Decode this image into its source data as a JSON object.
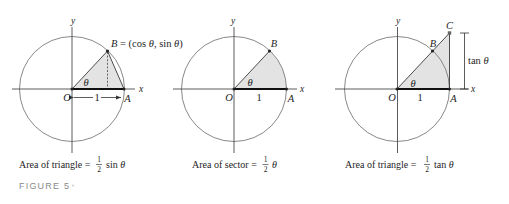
{
  "figure": {
    "label": "FIGURE 5"
  },
  "colors": {
    "shade": "#e3e3e3",
    "circle": "#7a7a7a",
    "axis": "#4a4a4a",
    "bold_radius": "#111111",
    "figure_label": "#8a8a8a"
  },
  "panels": [
    {
      "name": "triangle-OAB",
      "axis_x": "x",
      "axis_y": "y",
      "points": {
        "O": "O",
        "A": "A",
        "B": "B"
      },
      "b_coords": {
        "eq": " = (cos ",
        "theta1": "θ",
        "sep": ", sin ",
        "theta2": "θ",
        "close": ")"
      },
      "angle": "θ",
      "radius_label": "1",
      "caption": {
        "text": "Area of triangle = ",
        "num": "1",
        "den": "2",
        "fn": "sin ",
        "var": "θ"
      }
    },
    {
      "name": "sector-OAB",
      "axis_x": "x",
      "axis_y": "y",
      "points": {
        "O": "O",
        "A": "A",
        "B": "B"
      },
      "angle": "θ",
      "radius_label": "1",
      "caption": {
        "text": "Area of sector = ",
        "num": "1",
        "den": "2",
        "var": "θ"
      }
    },
    {
      "name": "triangle-OAC",
      "axis_x": "x",
      "axis_y": "y",
      "points": {
        "O": "O",
        "A": "A",
        "B": "B",
        "C": "C"
      },
      "angle": "θ",
      "radius_label": "1",
      "tan_label": {
        "fn": "tan ",
        "var": "θ"
      },
      "caption": {
        "text": "Area of triangle = ",
        "num": "1",
        "den": "2",
        "fn": "tan ",
        "var": "θ"
      }
    }
  ]
}
